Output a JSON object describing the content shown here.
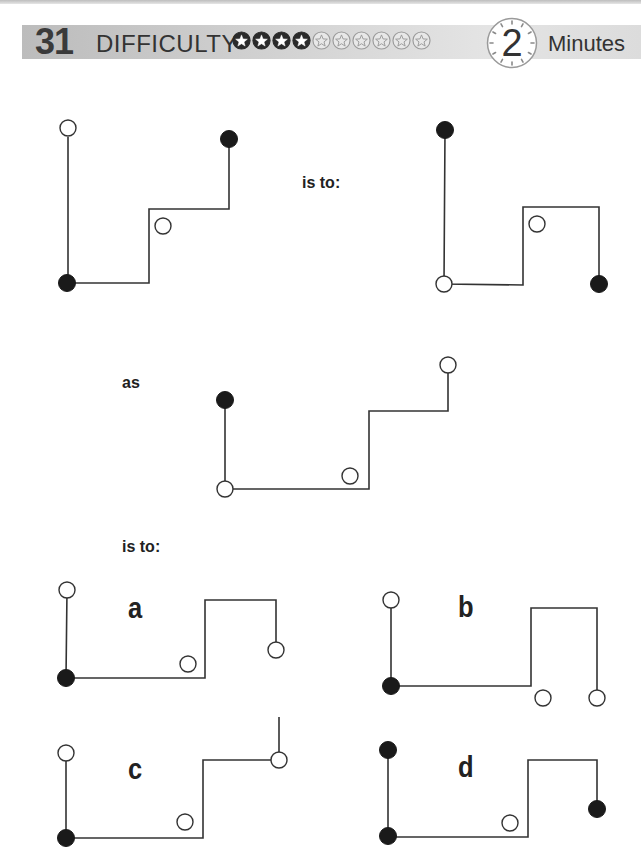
{
  "header": {
    "puzzle_number": "31",
    "difficulty_label": "DIFFICULTY",
    "difficulty_rating": 4,
    "difficulty_max": 10,
    "time_value": "2",
    "time_unit": "Minutes"
  },
  "text": {
    "is_to_1": "is to:",
    "as": "as",
    "is_to_2": "is to:"
  },
  "options": [
    {
      "label": "a"
    },
    {
      "label": "b"
    },
    {
      "label": "c"
    },
    {
      "label": "d"
    }
  ],
  "colors": {
    "line": "#333333",
    "filled_circle": "#1a1a1a",
    "open_circle_fill": "#ffffff",
    "header_bar": "#cfcfcf",
    "number": "#3a3a3a"
  },
  "figures": {
    "example_1": {
      "path": "68,137 68,283 149,283 149,209 229,209 229,139",
      "circles": [
        {
          "cx": 68,
          "cy": 128,
          "type": "open"
        },
        {
          "cx": 67,
          "cy": 283,
          "type": "filled"
        },
        {
          "cx": 229,
          "cy": 139,
          "type": "filled"
        },
        {
          "cx": 163,
          "cy": 226,
          "type": "open"
        }
      ]
    },
    "example_2": {
      "path": "445,130 444,284 523,285 523,207 599,207 599,284",
      "circles": [
        {
          "cx": 445,
          "cy": 130,
          "type": "filled"
        },
        {
          "cx": 444,
          "cy": 284,
          "type": "open"
        },
        {
          "cx": 599,
          "cy": 284,
          "type": "filled"
        },
        {
          "cx": 537,
          "cy": 224,
          "type": "open"
        }
      ]
    },
    "question": {
      "path": "225,400 225,489 369,489 369,411 448,411 448,365",
      "circles": [
        {
          "cx": 225,
          "cy": 400,
          "type": "filled"
        },
        {
          "cx": 225,
          "cy": 489,
          "type": "open"
        },
        {
          "cx": 448,
          "cy": 365,
          "type": "open"
        },
        {
          "cx": 350,
          "cy": 476,
          "type": "open"
        }
      ]
    },
    "option_a": {
      "path": "67,590 66,678 205,678 205,600 276,600 276,650",
      "circles": [
        {
          "cx": 67,
          "cy": 590,
          "type": "open"
        },
        {
          "cx": 66,
          "cy": 678,
          "type": "filled"
        },
        {
          "cx": 276,
          "cy": 650,
          "type": "open"
        },
        {
          "cx": 188,
          "cy": 664,
          "type": "open"
        }
      ]
    },
    "option_b": {
      "path": "391,600 391,686 531,686 531,608 597,608 597,698",
      "circles": [
        {
          "cx": 391,
          "cy": 600,
          "type": "open"
        },
        {
          "cx": 391,
          "cy": 686,
          "type": "filled"
        },
        {
          "cx": 597,
          "cy": 698,
          "type": "open"
        },
        {
          "cx": 543,
          "cy": 698,
          "type": "open"
        }
      ]
    },
    "option_c": {
      "path": "66,753 66,838 203,838 203,760 279,760 279,717",
      "circles": [
        {
          "cx": 66,
          "cy": 753,
          "type": "open"
        },
        {
          "cx": 66,
          "cy": 838,
          "type": "filled"
        },
        {
          "cx": 279,
          "cy": 760,
          "type": "open"
        },
        {
          "cx": 185,
          "cy": 822,
          "type": "open"
        }
      ]
    },
    "option_d": {
      "path": "388,750 388,837 528,837 528,760 597,760 597,809",
      "circles": [
        {
          "cx": 388,
          "cy": 750,
          "type": "filled"
        },
        {
          "cx": 388,
          "cy": 836,
          "type": "filled"
        },
        {
          "cx": 597,
          "cy": 809,
          "type": "filled"
        },
        {
          "cx": 510,
          "cy": 823,
          "type": "open"
        }
      ]
    }
  }
}
